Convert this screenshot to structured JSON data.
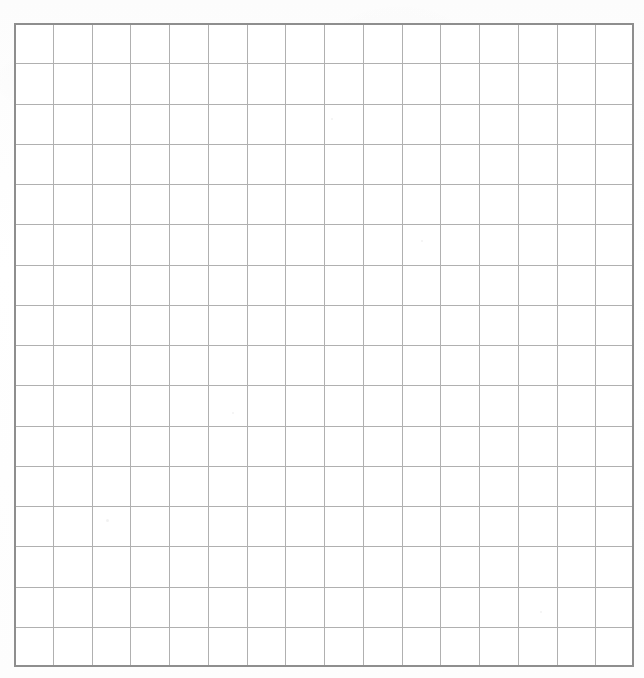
{
  "document": {
    "title": "Blank grid worksheet",
    "kind": "scanned-graph-paper",
    "background_color": "#fefefe"
  },
  "grid": {
    "columns": 16,
    "rows": 16,
    "origin_x": 14,
    "origin_y": 23,
    "width": 620,
    "height": 644,
    "cell_width": 38.75,
    "cell_height": 40.25,
    "line_color": "#b0b0b0",
    "border_color": "#8e8e8e",
    "line_width": 1,
    "border_width": 2,
    "fill_color": "#ffffff",
    "labels": [],
    "cell_values": []
  },
  "specks": [
    {
      "x": 106,
      "y": 519,
      "size": 3
    },
    {
      "x": 421,
      "y": 240,
      "size": 2
    },
    {
      "x": 232,
      "y": 412,
      "size": 2
    },
    {
      "x": 540,
      "y": 611,
      "size": 2
    },
    {
      "x": 331,
      "y": 118,
      "size": 2
    }
  ]
}
